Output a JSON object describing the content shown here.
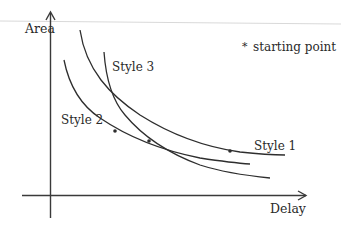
{
  "diagram": {
    "axes": {
      "y_label": "Area",
      "x_label": "Delay"
    },
    "legend": {
      "marker": "*",
      "text": "starting point"
    },
    "curves": [
      {
        "label": "Style 1"
      },
      {
        "label": "Style 2"
      },
      {
        "label": "Style 3"
      }
    ],
    "colors": {
      "stroke": "#2e2e2e",
      "background": "#ffffff",
      "top_rule": "#d6d6d6"
    }
  }
}
